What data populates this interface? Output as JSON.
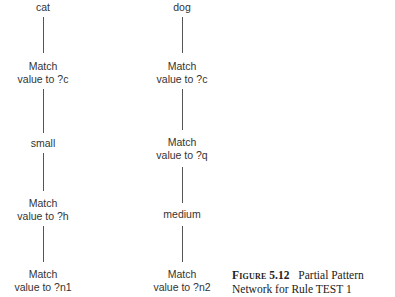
{
  "diagram": {
    "type": "pattern-network",
    "columns": [
      {
        "id": "left",
        "nodes": [
          {
            "lines": [
              "cat"
            ]
          },
          {
            "lines": [
              "Match",
              "value to ?c"
            ]
          },
          {
            "lines": [
              "small"
            ]
          },
          {
            "lines": [
              "Match",
              "value to ?h"
            ]
          },
          {
            "lines": [
              "Match",
              "value to ?n1"
            ]
          }
        ]
      },
      {
        "id": "right",
        "nodes": [
          {
            "lines": [
              "dog"
            ]
          },
          {
            "lines": [
              "Match",
              "value to ?c"
            ]
          },
          {
            "lines": [
              "Match",
              "value to ?q"
            ]
          },
          {
            "lines": [
              "medium"
            ]
          },
          {
            "lines": [
              "Match",
              "value to ?n2"
            ]
          }
        ]
      }
    ],
    "edges": [
      [
        "cat",
        "Match value to ?c"
      ],
      [
        "Match value to ?c",
        "small"
      ],
      [
        "small",
        "Match value to ?h"
      ],
      [
        "Match value to ?h",
        "Match value to ?n1"
      ],
      [
        "dog",
        "Match value to ?c"
      ],
      [
        "Match value to ?c",
        "Match value to ?q"
      ],
      [
        "Match value to ?q",
        "medium"
      ],
      [
        "medium",
        "Match value to ?n2"
      ]
    ]
  },
  "caption": {
    "label": "Figure",
    "number": "5.12",
    "title_line1": "Partial Pattern",
    "title_line2": "Network for Rule TEST 1"
  },
  "colors": {
    "text": "#333333",
    "edge": "#555555",
    "background": "#ffffff"
  }
}
